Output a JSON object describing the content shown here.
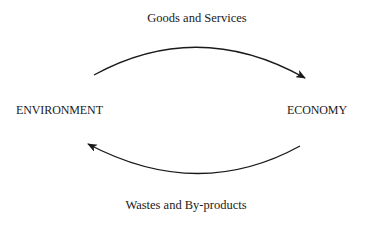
{
  "diagram": {
    "nodes": {
      "left": "ENVIRONMENT",
      "right": "ECONOMY"
    },
    "edges": {
      "top": {
        "label": "Goods and Services",
        "from": "ENVIRONMENT",
        "to": "ECONOMY"
      },
      "bottom": {
        "label": "Wastes and By-products",
        "from": "ECONOMY",
        "to": "ENVIRONMENT"
      }
    },
    "colors": {
      "stroke": "#1a1a1a",
      "background": "#ffffff"
    }
  }
}
